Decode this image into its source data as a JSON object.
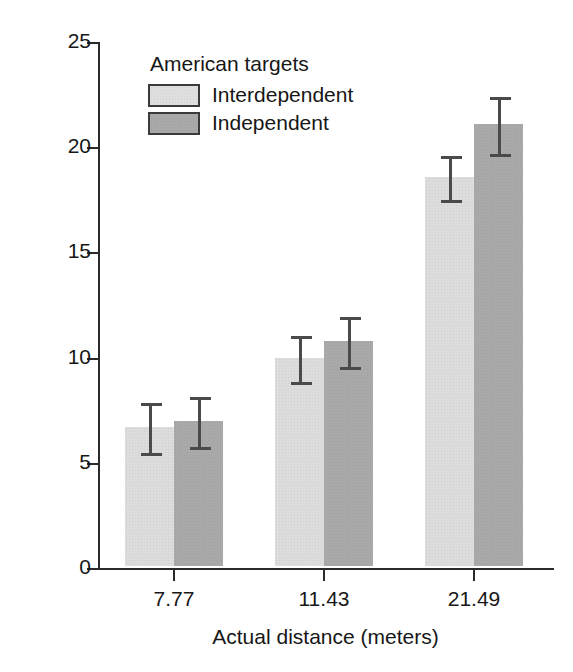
{
  "chart_data": {
    "type": "bar",
    "title": "",
    "subtitle": "",
    "xlabel": "Actual distance (meters)",
    "ylabel": "Estimate (secs)",
    "categories": [
      "7.77",
      "11.43",
      "21.49"
    ],
    "ylim": [
      0,
      25
    ],
    "yticks": [
      "0",
      "5",
      "10",
      "15",
      "20",
      "25"
    ],
    "ytick_values": [
      0,
      5,
      10,
      15,
      20,
      25
    ],
    "grid": false,
    "legend_position": "top-left-inside",
    "legend_title": "American targets",
    "series": [
      {
        "name": "Interdependent",
        "color": "#dcdcdc",
        "values": [
          6.6,
          9.9,
          18.5
        ],
        "errors": [
          1.2,
          1.1,
          1.05
        ]
      },
      {
        "name": "Independent",
        "color": "#a9a9a9",
        "values": [
          6.9,
          10.7,
          21.0
        ],
        "errors": [
          1.2,
          1.2,
          1.35
        ]
      }
    ],
    "annotations": []
  },
  "colors": {
    "axis": "#2b2b2b",
    "text": "#171717",
    "error_bar": "#4a4a4a",
    "background": "#ffffff"
  }
}
